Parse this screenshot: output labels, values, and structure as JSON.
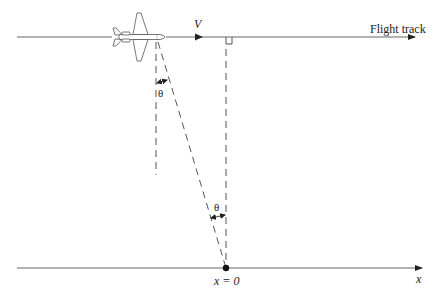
{
  "diagram": {
    "type": "geometry-diagram",
    "labels": {
      "velocity": "V",
      "flight_track": "Flight track",
      "theta_top": "θ",
      "theta_bottom": "θ",
      "origin": "x = 0",
      "x_axis": "x"
    },
    "elements": [
      {
        "id": "flight-track-line",
        "kind": "line",
        "from": [
          17,
          37
        ],
        "to": [
          415,
          37
        ],
        "arrow": "end"
      },
      {
        "id": "velocity-arrow",
        "kind": "arrowhead",
        "at": [
          199,
          37
        ]
      },
      {
        "id": "ground-axis",
        "kind": "line",
        "from": [
          17,
          268
        ],
        "to": [
          422,
          268
        ],
        "arrow": "end"
      },
      {
        "id": "aircraft",
        "kind": "icon",
        "center": [
          138,
          37
        ]
      },
      {
        "id": "vertical-dashed-left",
        "kind": "dashed-line",
        "from": [
          156,
          42
        ],
        "to": [
          156,
          175
        ]
      },
      {
        "id": "slant-dashed",
        "kind": "dashed-line",
        "from": [
          158,
          42
        ],
        "to": [
          226,
          268
        ]
      },
      {
        "id": "vertical-dashed-right",
        "kind": "dashed-line",
        "from": [
          226,
          37
        ],
        "to": [
          226,
          268
        ]
      },
      {
        "id": "right-angle-marker",
        "kind": "square",
        "at": [
          226,
          37
        ],
        "size": 6
      },
      {
        "id": "origin-point",
        "kind": "dot",
        "at": [
          226,
          268
        ]
      }
    ],
    "colors": {
      "line": "#555555",
      "text": "#222222",
      "background": "#ffffff"
    }
  }
}
